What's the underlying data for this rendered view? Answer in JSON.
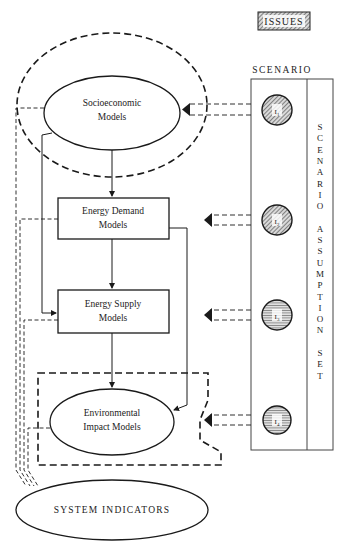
{
  "legend": {
    "issues_label": "ISSUES"
  },
  "scenario": {
    "title": "SCENARIO",
    "vertical_label_letters": [
      "S",
      "C",
      "E",
      "N",
      "A",
      "R",
      "I",
      "O",
      "",
      "A",
      "S",
      "S",
      "U",
      "M",
      "P",
      "T",
      "I",
      "O",
      "N",
      "",
      "S",
      "E",
      "T"
    ],
    "vertical_label": "SCENARIO ASSUMPTION SET",
    "issues": [
      {
        "id": "I1",
        "label": "I",
        "sub": "1"
      },
      {
        "id": "I2",
        "label": "I",
        "sub": "2"
      },
      {
        "id": "I3",
        "label": "I",
        "sub": "3"
      },
      {
        "id": "I4",
        "label": "I",
        "sub": "4"
      }
    ]
  },
  "nodes": {
    "socioeconomic": {
      "line1": "Socioeconomic",
      "line2": "Models"
    },
    "energy_demand": {
      "line1": "Energy Demand",
      "line2": "Models"
    },
    "energy_supply": {
      "line1": "Energy Supply",
      "line2": "Models"
    },
    "environmental": {
      "line1": "Environmental",
      "line2": "Impact Models"
    },
    "system_indicators": {
      "label": "SYSTEM INDICATORS"
    }
  },
  "colors": {
    "line": "#1a1a1a",
    "hatch": "#555555",
    "background": "#ffffff"
  }
}
